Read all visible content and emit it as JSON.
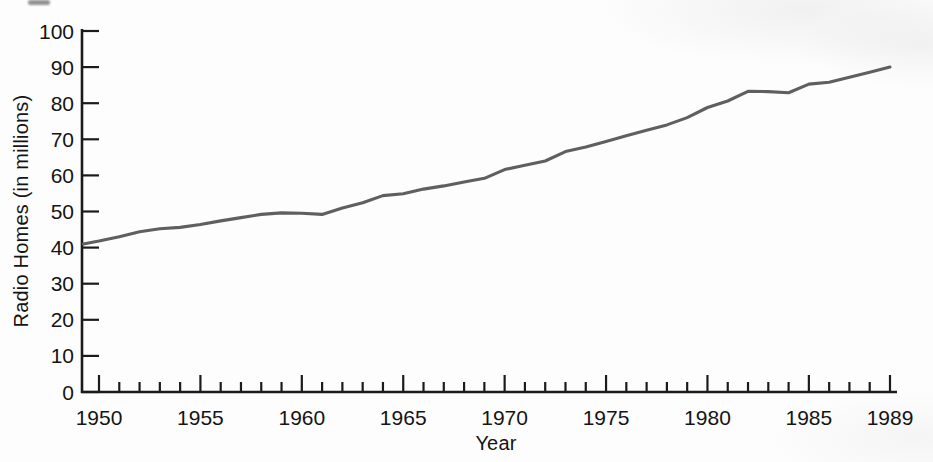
{
  "figure": {
    "ylabel": "Radio Homes (in millions)",
    "xlabel": "Year"
  },
  "chart_data": {
    "type": "line",
    "title": "",
    "xlabel": "Year",
    "ylabel": "Radio Homes (in millions)",
    "xlim": [
      1949,
      1989
    ],
    "ylim": [
      0,
      100
    ],
    "y_tick_step": 10,
    "y_tick_labels": [
      "0",
      "10",
      "20",
      "30",
      "40",
      "50",
      "60",
      "70",
      "80",
      "90",
      "100"
    ],
    "x_labeled_ticks": [
      1950,
      1955,
      1960,
      1965,
      1970,
      1975,
      1980,
      1985,
      1989
    ],
    "x_minor_tick_every": 1,
    "grid": false,
    "legend_position": "none",
    "line_color": "#5f5f5f",
    "axis_color": "#1b1b1b",
    "series": [
      {
        "name": "Radio Homes",
        "x": [
          1949,
          1950,
          1951,
          1952,
          1953,
          1954,
          1955,
          1956,
          1957,
          1958,
          1959,
          1960,
          1961,
          1962,
          1963,
          1964,
          1965,
          1966,
          1967,
          1968,
          1969,
          1970,
          1971,
          1972,
          1973,
          1974,
          1975,
          1976,
          1977,
          1978,
          1979,
          1980,
          1981,
          1982,
          1983,
          1984,
          1985,
          1986,
          1987,
          1988,
          1989
        ],
        "values": [
          41.0,
          41.8,
          43.0,
          44.4,
          45.2,
          45.6,
          46.4,
          47.4,
          48.3,
          49.2,
          49.6,
          49.5,
          49.2,
          51.0,
          52.4,
          54.4,
          54.9,
          56.2,
          57.1,
          58.2,
          59.2,
          61.6,
          62.8,
          64.0,
          66.6,
          67.9,
          69.4,
          71.0,
          72.5,
          74.0,
          76.0,
          78.8,
          80.6,
          83.3,
          83.2,
          82.9,
          85.3,
          85.8,
          87.2,
          88.6,
          90.0
        ]
      }
    ]
  }
}
